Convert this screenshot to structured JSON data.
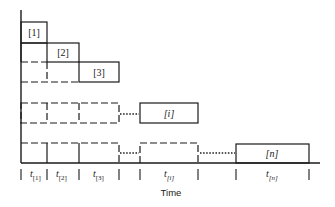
{
  "diagram": {
    "type": "gantt-like staircase schedule",
    "jobs": [
      {
        "label": "[1]",
        "italic": false
      },
      {
        "label": "[2]",
        "italic": false
      },
      {
        "label": "[3]",
        "italic": false
      },
      {
        "label": "[i]",
        "italic": true
      },
      {
        "label": "[n]",
        "italic": true
      }
    ],
    "intervals": [
      {
        "main": "t",
        "sub": "[1]"
      },
      {
        "main": "t",
        "sub": "[2]"
      },
      {
        "main": "t",
        "sub": "[3]"
      },
      {
        "main": "t",
        "sub": "[i]"
      },
      {
        "main": "t",
        "sub": "[n]"
      }
    ],
    "xlabel": "Time",
    "stroke_color": "#1a1a1a"
  }
}
